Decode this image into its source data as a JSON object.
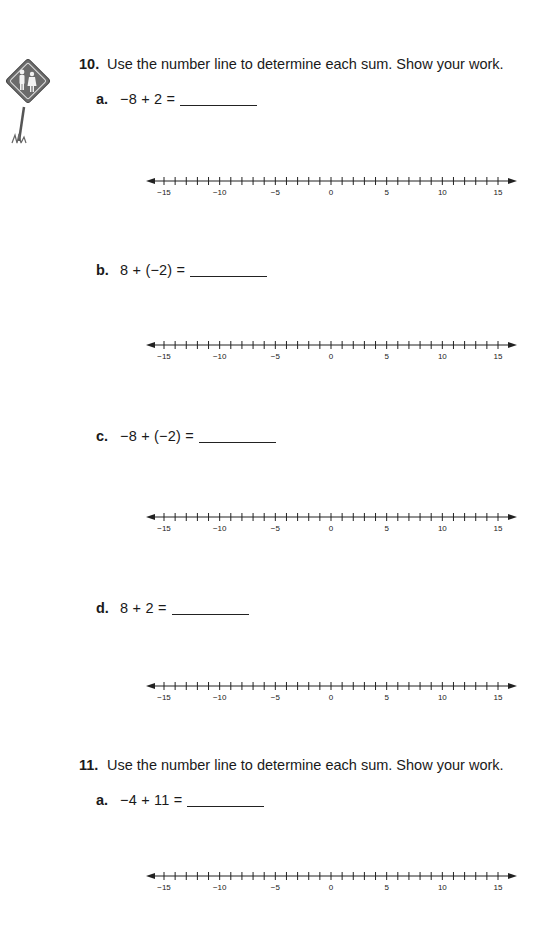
{
  "sign_icon": "pedestrian-crossing-sign-icon",
  "problems": [
    {
      "number": "10.",
      "instruction": "Use the number line to determine each sum. Show your work.",
      "parts": [
        {
          "letter": "a.",
          "expression": "−8 + 2 =",
          "answer": ""
        },
        {
          "letter": "b.",
          "expression": "8 + (−2) =",
          "answer": ""
        },
        {
          "letter": "c.",
          "expression": "−8 + (−2) =",
          "answer": ""
        },
        {
          "letter": "d.",
          "expression": "8 + 2 =",
          "answer": ""
        }
      ]
    },
    {
      "number": "11.",
      "instruction": "Use the number line to determine each sum. Show your work.",
      "parts": [
        {
          "letter": "a.",
          "expression": "−4 + 11 =",
          "answer": ""
        }
      ]
    }
  ],
  "number_line": {
    "min": -15,
    "max": 15,
    "step": 1,
    "labels": [
      "−15",
      "−10",
      "−5",
      "0",
      "5",
      "10",
      "15"
    ],
    "label_values": [
      -15,
      -10,
      -5,
      0,
      5,
      10,
      15
    ]
  }
}
